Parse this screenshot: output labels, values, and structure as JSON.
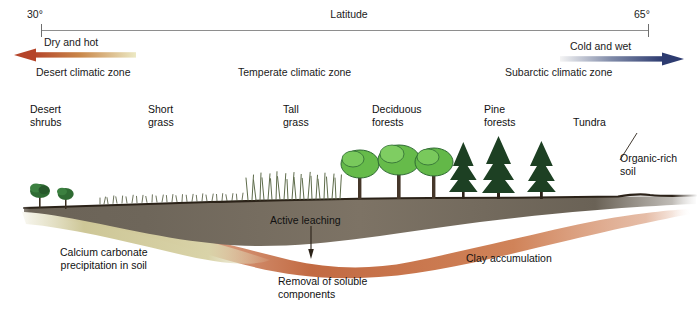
{
  "axis": {
    "title": "Latitude",
    "left_tick": "30°",
    "right_tick": "65°"
  },
  "gradients": {
    "left": {
      "label": "Dry and hot",
      "direction": "left",
      "color_head": "#b5452a",
      "color_tail": "#ece9c4"
    },
    "right": {
      "label": "Cold and wet",
      "direction": "right",
      "color_head": "#2d3b70",
      "color_tail": "#f2f2f2"
    }
  },
  "climatic_zones": [
    {
      "label": "Desert climatic zone"
    },
    {
      "label": "Temperate climatic zone"
    },
    {
      "label": "Subarctic climatic zone"
    }
  ],
  "vegetation": [
    {
      "label": "Desert\nshrubs"
    },
    {
      "label": "Short\ngrass"
    },
    {
      "label": "Tall\ngrass"
    },
    {
      "label": "Deciduous\nforests"
    },
    {
      "label": "Pine\nforests"
    },
    {
      "label": "Tundra"
    }
  ],
  "soil_annotations": {
    "calcium": "Calcium carbonate\nprecipitation in soil",
    "leaching": "Active leaching",
    "removal": "Removal of soluble\ncomponents",
    "clay": "Clay accumulation",
    "organic": "Organic-rich\nsoil"
  },
  "colors": {
    "topsoil_dark": "#5d554b",
    "topsoil_light": "#8b8071",
    "clay_orange": "#c9754c",
    "carbonate_khaki": "#cfc99a",
    "surface_line": "#2b2218",
    "deciduous_green": "#66bb4a",
    "conifer_green": "#1d4023",
    "shrub_green": "#2f6b33",
    "grass_green": "#6f7f5a",
    "axis_grey": "#8e8e8e"
  }
}
